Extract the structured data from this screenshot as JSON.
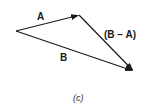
{
  "diagram": {
    "vectors": [
      {
        "name": "A",
        "label": "A",
        "from": [
          16,
          31
        ],
        "to": [
          79,
          15
        ]
      },
      {
        "name": "B",
        "label": "B",
        "from": [
          16,
          31
        ],
        "to": [
          133,
          71
        ]
      },
      {
        "name": "B-A",
        "label": "(B − A)",
        "from": [
          79,
          15
        ],
        "to": [
          133,
          71
        ]
      }
    ],
    "caption": "(c)",
    "colors": {
      "stroke": "#1a1a1a",
      "background": "#ffffff"
    }
  }
}
